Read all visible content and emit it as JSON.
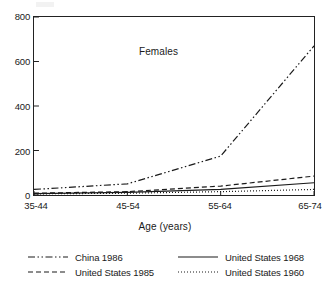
{
  "chart_data": {
    "type": "line",
    "title": "",
    "annotation": "Females",
    "xlabel": "Age (years)",
    "ylabel": "",
    "categories": [
      "35-44",
      "45-54",
      "55-64",
      "65-74"
    ],
    "ylim": [
      0,
      800
    ],
    "yticks": [
      0,
      200,
      400,
      600,
      800
    ],
    "grid": false,
    "legend_position": "below-plot",
    "series": [
      {
        "name": "China 1986",
        "values": [
          25,
          50,
          175,
          670
        ],
        "linestyle": "dash-dot-dot",
        "color": "#1a1a1a"
      },
      {
        "name": "United States 1985",
        "values": [
          8,
          15,
          40,
          85
        ],
        "linestyle": "dashed",
        "color": "#1a1a1a"
      },
      {
        "name": "United States 1968",
        "values": [
          6,
          12,
          25,
          55
        ],
        "linestyle": "solid",
        "color": "#1a1a1a"
      },
      {
        "name": "United States 1960",
        "values": [
          5,
          8,
          15,
          25
        ],
        "linestyle": "dotted",
        "color": "#1a1a1a"
      }
    ]
  },
  "axes": {
    "y_tick_labels": [
      "800",
      "600",
      "400",
      "200",
      "0"
    ],
    "x_tick_labels": [
      "35-44",
      "45-54",
      "55-64",
      "65-74"
    ],
    "x_axis_title": "Age (years)"
  },
  "legend": {
    "entries": [
      {
        "label": "China 1986",
        "style": "dash-dot-dot"
      },
      {
        "label": "United States 1968",
        "style": "solid"
      },
      {
        "label": "United States 1985",
        "style": "dashed"
      },
      {
        "label": "United States 1960",
        "style": "dotted"
      }
    ]
  }
}
